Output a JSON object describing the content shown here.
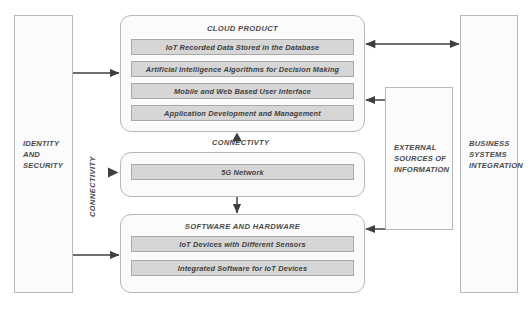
{
  "diagram": {
    "title_hidden": true,
    "colors": {
      "box_fill": "#fbfbfb",
      "box_border": "#b8b8b8",
      "bar_fill": "#d6d6d6",
      "bar_border": "#a9a9a9",
      "text": "#4a4a4a",
      "arrow": "#3f3f3f"
    }
  },
  "left_panel": {
    "label": "IDENTITY\nAND\nSECURITY"
  },
  "connectivity_vertical_label": "CONNECTIVITY",
  "connectivity_label": "CONNECTIVTY",
  "cloud_product": {
    "title": "CLOUD PRODUCT",
    "items": [
      {
        "label": "IoT Recorded Data Stored in the Database"
      },
      {
        "label": "Artificial Intelligence Algorithms for Decision Making"
      },
      {
        "label": "Mobile and Web Based User Interface"
      },
      {
        "label": "Application Development and Management"
      }
    ]
  },
  "network": {
    "items": [
      {
        "label": "5G Network"
      }
    ]
  },
  "software_hardware": {
    "title": "SOFTWARE AND HARDWARE",
    "items": [
      {
        "label": "IoT Devices with Different Sensors"
      },
      {
        "label": "Integrated Software for IoT Devices"
      }
    ]
  },
  "external_sources": {
    "label": "EXTERNAL\nSOURCES OF\nINFORMATION"
  },
  "business_systems": {
    "label": "BUSINESS\nSYSTEMS\nINTEGRATION"
  }
}
